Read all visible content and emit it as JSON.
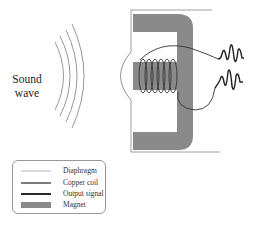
{
  "diagram": {
    "type": "microphone-schematic",
    "sound_label_line1": "Sound",
    "sound_label_line2": "wave",
    "sound_wave_arcs": 4,
    "coil_turns": 6,
    "output_signals": 2,
    "colors": {
      "diaphragm": "#888888",
      "copper_coil": "#333333",
      "output_signal": "#222222",
      "magnet": "#8a8a8a",
      "housing": "#777777"
    }
  },
  "legend": {
    "items": [
      {
        "label": "Diaphragm",
        "style": "thin-light-line"
      },
      {
        "label": "Copper coil",
        "style": "medium-dark-line"
      },
      {
        "label": "Output signal",
        "style": "thick-black-line"
      },
      {
        "label": "Magnet",
        "style": "gray-bar"
      }
    ]
  }
}
